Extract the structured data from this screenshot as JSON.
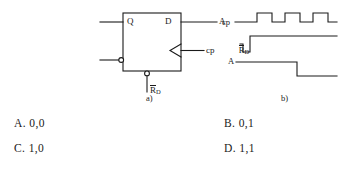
{
  "figure": {
    "circuit": {
      "caption": "a)",
      "block_labels": {
        "q_pin": "Q",
        "d_pin": "D",
        "clock": "cp",
        "reset_overbar": "R",
        "reset_subscript": "D"
      }
    },
    "timing": {
      "caption": "b)",
      "signals": [
        {
          "name": "cp",
          "has_overbar": false,
          "subscript": ""
        },
        {
          "name": "R",
          "has_overbar": true,
          "subscript": "D"
        },
        {
          "name": "A",
          "has_overbar": false,
          "subscript": ""
        }
      ]
    }
  },
  "waveforms": {
    "cp": {
      "label": "cp",
      "initial_level": "low",
      "pulses": 3,
      "description": "three positive pulses"
    },
    "rd": {
      "label": "R",
      "initial_level": "high",
      "pulses": 1,
      "description": "one negative pulse near start"
    },
    "a": {
      "label": "A",
      "initial_level": "high",
      "pulses": 0,
      "description": "falls low after third clock pulse"
    }
  },
  "choices": [
    {
      "key": "A.",
      "value": "0,0"
    },
    {
      "key": "B.",
      "value": "0,1"
    },
    {
      "key": "C.",
      "value": "1,0"
    },
    {
      "key": "D.",
      "value": "1,1"
    }
  ],
  "colors": {
    "ink": "#1a1a1a",
    "background": "#ffffff"
  }
}
